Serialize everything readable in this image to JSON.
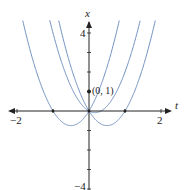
{
  "chart_data": {
    "type": "line",
    "title": "",
    "xlabel": "t",
    "ylabel": "x",
    "xlim": [
      -2.2,
      2.3
    ],
    "ylim": [
      -4,
      4.6
    ],
    "x_tick_labels": [
      "-2",
      "2"
    ],
    "y_tick_labels": [
      "4",
      "-4"
    ],
    "grid": false,
    "legend": null,
    "curve_color": "#6f8fc0",
    "axis_color": "#222222",
    "series": [
      {
        "name": "x = 3t^2 + 3t",
        "a": 3,
        "b": 3,
        "c": 0
      },
      {
        "name": "x = 3t^2 - 3t",
        "a": 3,
        "b": -3,
        "c": 0
      },
      {
        "name": "x = 3t^2 - t",
        "a": 3,
        "b": -1,
        "c": 0
      }
    ],
    "annotations": [
      {
        "text": "(0, 1)",
        "x": 0,
        "y": 1,
        "marker": "dot"
      }
    ],
    "marked_points": [
      {
        "x": -1,
        "y": 0
      },
      {
        "x": 0,
        "y": 0
      },
      {
        "x": 1,
        "y": 0
      },
      {
        "x": 0,
        "y": 1
      }
    ]
  },
  "labels": {
    "t_axis": "t",
    "x_axis": "x",
    "t_neg": "−2",
    "t_pos": "2",
    "x_pos": "4",
    "x_neg": "−4",
    "point": "(0, 1)"
  }
}
